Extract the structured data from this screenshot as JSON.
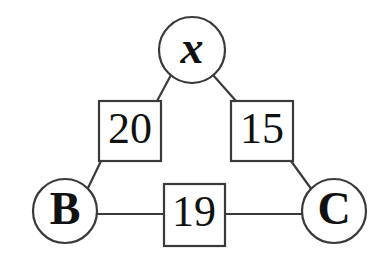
{
  "diagram": {
    "kind": "weighted-triangle-graph",
    "background_color": "#ffffff",
    "stroke_color": "#3a3a3a",
    "text_color": "#111111",
    "vertices": [
      {
        "id": "x",
        "label": "x",
        "shape": "circle",
        "cx": 192,
        "cy": 50,
        "r": 33
      },
      {
        "id": "B",
        "label": "B",
        "shape": "circle",
        "cx": 65,
        "cy": 211,
        "r": 32
      },
      {
        "id": "C",
        "label": "C",
        "shape": "circle",
        "cx": 334,
        "cy": 211,
        "r": 32
      }
    ],
    "weights": [
      {
        "id": "w-left",
        "label": "20",
        "shape": "square",
        "x": 99,
        "y": 101,
        "w": 62,
        "h": 60,
        "edge": "x-B"
      },
      {
        "id": "w-right",
        "label": "15",
        "shape": "square",
        "x": 231,
        "y": 101,
        "w": 62,
        "h": 60,
        "edge": "x-C"
      },
      {
        "id": "w-bottom",
        "label": "19",
        "shape": "square",
        "x": 164,
        "y": 184,
        "w": 61,
        "h": 62,
        "edge": "B-C"
      }
    ],
    "edges": [
      {
        "id": "edge-x-left-box",
        "from": "x",
        "to": "w-left",
        "x1": 171,
        "y1": 75,
        "x2": 157,
        "y2": 101
      },
      {
        "id": "edge-x-right-box",
        "from": "x",
        "to": "w-right",
        "x1": 213,
        "y1": 75,
        "x2": 236,
        "y2": 101
      },
      {
        "id": "edge-left-box-B",
        "from": "w-left",
        "to": "B",
        "x1": 101,
        "y1": 161,
        "x2": 87,
        "y2": 190
      },
      {
        "id": "edge-right-box-C",
        "from": "w-right",
        "to": "C",
        "x1": 291,
        "y1": 161,
        "x2": 312,
        "y2": 190
      },
      {
        "id": "edge-B-bottom-box",
        "from": "B",
        "to": "w-bottom",
        "x1": 97,
        "y1": 214,
        "x2": 164,
        "y2": 214
      },
      {
        "id": "edge-bottom-box-C",
        "from": "w-bottom",
        "to": "C",
        "x1": 225,
        "y1": 214,
        "x2": 302,
        "y2": 214
      }
    ]
  }
}
